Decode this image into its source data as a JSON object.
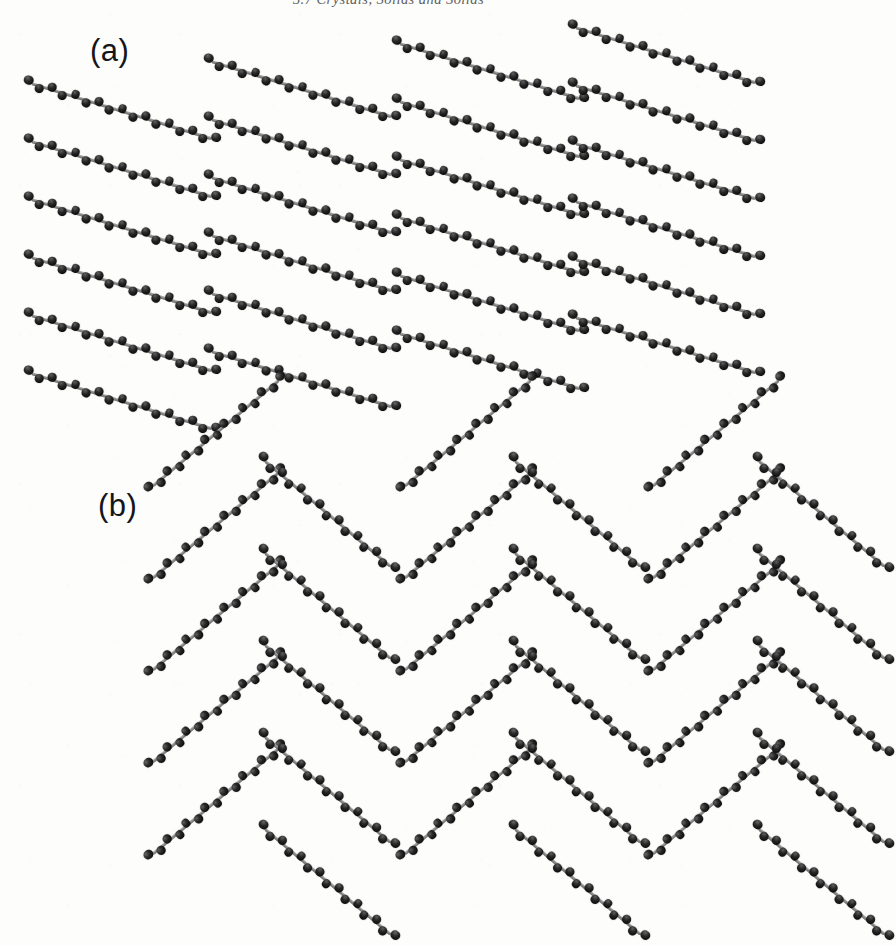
{
  "page": {
    "running_header": "3.7  Crystals, Solids and Solids",
    "background_color": "#fdfdfc",
    "width": 777,
    "height": 910
  },
  "figure": {
    "caption_labels": [
      "(a)",
      "(b)"
    ],
    "render_style": "ball-and-stick",
    "atom_color": "#141414",
    "bond_color": "#8d8d8d"
  },
  "panels": [
    {
      "id": "panel-a",
      "label": "(a)",
      "packing_motif": "parallel layered",
      "tilt_angles_deg": [
        17
      ],
      "columns": 4,
      "rows_per_column": 6,
      "chain_length_px": 196,
      "atoms_per_chain": 17,
      "row_spacing_px": 58,
      "column_spacing_px": 186,
      "column_stagger_px": -22,
      "columns_spec": [
        {
          "x": 28,
          "y": 62,
          "rows": 6,
          "angle": 17
        },
        {
          "x": 208,
          "y": 40,
          "rows": 6,
          "angle": 17
        },
        {
          "x": 396,
          "y": 22,
          "rows": 6,
          "angle": 17
        },
        {
          "x": 572,
          "y": 6,
          "rows": 6,
          "angle": 17
        }
      ]
    },
    {
      "id": "panel-b",
      "label": "(b)",
      "packing_motif": "herringbone",
      "tilt_angles_deg": [
        -40,
        40
      ],
      "columns": 6,
      "rows_per_column": 5,
      "chain_length_px": 172,
      "atoms_per_chain": 15,
      "row_spacing_px": 92,
      "column_spacing_px": 128,
      "columns_spec": [
        {
          "x": 150,
          "y": 52,
          "rows": 5,
          "angle": -40
        },
        {
          "x": 262,
          "y": 22,
          "rows": 5,
          "angle": 40
        },
        {
          "x": 402,
          "y": 52,
          "rows": 5,
          "angle": -40
        },
        {
          "x": 512,
          "y": 22,
          "rows": 5,
          "angle": 40
        },
        {
          "x": 650,
          "y": 52,
          "rows": 5,
          "angle": -40
        },
        {
          "x": 756,
          "y": 22,
          "rows": 5,
          "angle": 40
        }
      ]
    }
  ]
}
